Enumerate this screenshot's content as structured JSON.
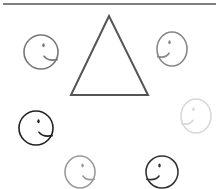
{
  "figure": {
    "type": "visual-puzzle",
    "top_rule": {
      "x1": 3,
      "x2": 216,
      "y": 4,
      "color": "#555555"
    },
    "triangle": {
      "points": [
        [
          109,
          16
        ],
        [
          71,
          95
        ],
        [
          148,
          95
        ]
      ],
      "stroke": "#555555",
      "stroke_width": 2
    },
    "faces": [
      {
        "id": "top-left",
        "cx": 41,
        "cy": 52,
        "rx": 17,
        "ry": 17,
        "color": "#777777",
        "facing": "right"
      },
      {
        "id": "top-right",
        "cx": 172,
        "cy": 49,
        "rx": 15,
        "ry": 17,
        "color": "#888888",
        "facing": "left"
      },
      {
        "id": "middle-left",
        "cx": 36,
        "cy": 128,
        "rx": 17,
        "ry": 17,
        "color": "#222222",
        "facing": "right"
      },
      {
        "id": "middle-right",
        "cx": 196,
        "cy": 116,
        "rx": 15,
        "ry": 17,
        "color": "#d9d9d9",
        "facing": "left"
      },
      {
        "id": "bottom-left",
        "cx": 80,
        "cy": 172,
        "rx": 15,
        "ry": 16,
        "color": "#999999",
        "facing": "right"
      },
      {
        "id": "bottom-right",
        "cx": 162,
        "cy": 172,
        "rx": 16,
        "ry": 16,
        "color": "#333333",
        "facing": "left"
      }
    ]
  }
}
